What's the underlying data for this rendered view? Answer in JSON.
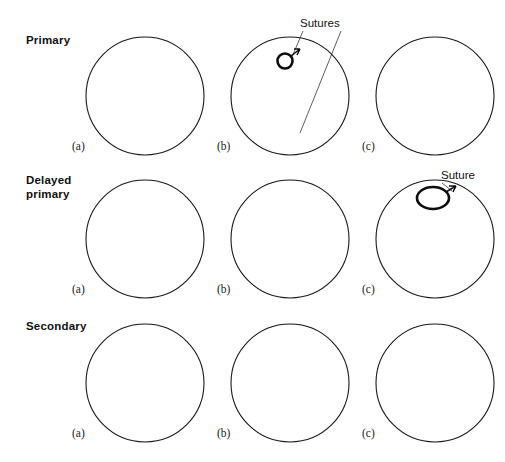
{
  "figure": {
    "background_color": "#ffffff",
    "ink_color": "#1a1a1a",
    "necrotic_color": "#0d0d0d"
  },
  "rows": [
    {
      "id": "primary",
      "label": "Primary",
      "panels": [
        {
          "id": "primary-a",
          "label": "(a)",
          "state": "open-incision"
        },
        {
          "id": "primary-b",
          "label": "(b)",
          "state": "sutured"
        },
        {
          "id": "primary-c",
          "label": "(c)",
          "state": "healed-scar"
        }
      ]
    },
    {
      "id": "delayed-primary",
      "label": "Delayed\nprimary",
      "label_line1": "Delayed",
      "label_line2": "primary",
      "panels": [
        {
          "id": "delayed-a",
          "label": "(a)",
          "state": "open-incision"
        },
        {
          "id": "delayed-b",
          "label": "(b)",
          "state": "contaminated-necrotic"
        },
        {
          "id": "delayed-c",
          "label": "(c)",
          "state": "delayed-closure-sutured"
        }
      ]
    },
    {
      "id": "secondary",
      "label": "Secondary",
      "panels": [
        {
          "id": "secondary-a",
          "label": "(a)",
          "state": "tissue-loss-defect"
        },
        {
          "id": "secondary-b",
          "label": "(b)",
          "state": "granulating-necrotic"
        },
        {
          "id": "secondary-c",
          "label": "(c)",
          "state": "contracted-scar"
        }
      ]
    }
  ],
  "callouts": [
    {
      "id": "sutures-callout",
      "text": "Sutures",
      "points_to": [
        "primary-b-skin-suture",
        "primary-b-deep-suture"
      ]
    },
    {
      "id": "suture-callout",
      "text": "Suture",
      "points_to": [
        "delayed-c-suture"
      ]
    }
  ],
  "layers": [
    {
      "id": "epidermis",
      "name": "epidermis",
      "pattern": "dense-hatch"
    },
    {
      "id": "dermis",
      "name": "dermis",
      "pattern": "cobblestone-cells"
    },
    {
      "id": "subcutaneous",
      "name": "subcutaneous",
      "pattern": "plain"
    },
    {
      "id": "fat",
      "name": "fat",
      "pattern": "stipple"
    }
  ]
}
